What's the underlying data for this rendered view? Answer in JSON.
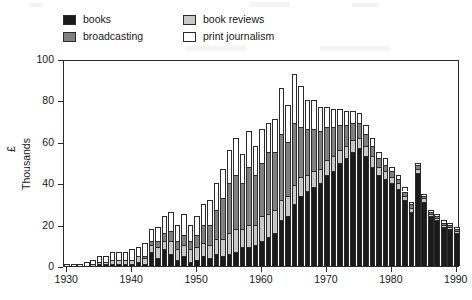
{
  "legend": {
    "items": [
      {
        "label": "books",
        "color": "#1a1a1a",
        "key": "books"
      },
      {
        "label": "broadcasting",
        "color": "#808080",
        "key": "broadcasting"
      },
      {
        "label": "book reviews",
        "color": "#c8c8c8",
        "key": "book_reviews"
      },
      {
        "label": "print journalism",
        "color": "#ffffff",
        "key": "print_journalism"
      }
    ]
  },
  "axes": {
    "y_unit": "£",
    "y_title": "Thousands",
    "y_ticks": [
      "0",
      "20",
      "40",
      "60",
      "80",
      "100"
    ],
    "x_ticks": [
      "1930",
      "1940",
      "1950",
      "1960",
      "1970",
      "1980",
      "1990"
    ]
  },
  "chart_data": {
    "type": "bar",
    "title": "",
    "subtitle": "",
    "xlabel": "",
    "ylabel": "£ Thousands",
    "ylim": [
      0,
      100
    ],
    "xlim": [
      1929.5,
      1990.5
    ],
    "grid": false,
    "stacked": true,
    "legend_position": "top-left",
    "stack_order_bottom_to_top": [
      "books",
      "book_reviews",
      "broadcasting",
      "print_journalism"
    ],
    "annotations": [],
    "categories": [
      1930,
      1931,
      1932,
      1933,
      1934,
      1935,
      1936,
      1937,
      1938,
      1939,
      1940,
      1941,
      1942,
      1943,
      1944,
      1945,
      1946,
      1947,
      1948,
      1949,
      1950,
      1951,
      1952,
      1953,
      1954,
      1955,
      1956,
      1957,
      1958,
      1959,
      1960,
      1961,
      1962,
      1963,
      1964,
      1965,
      1966,
      1967,
      1968,
      1969,
      1970,
      1971,
      1972,
      1973,
      1974,
      1975,
      1976,
      1977,
      1978,
      1979,
      1980,
      1981,
      1982,
      1983,
      1984,
      1985,
      1986,
      1987,
      1988,
      1989,
      1990
    ],
    "series": [
      {
        "name": "books",
        "color": "#1a1a1a",
        "values": [
          0,
          0,
          0,
          0,
          0,
          1,
          1,
          1,
          1,
          1,
          1,
          2,
          1,
          7,
          4,
          8,
          6,
          3,
          5,
          2,
          3,
          5,
          4,
          6,
          5,
          6,
          7,
          9,
          9,
          10,
          12,
          14,
          16,
          22,
          24,
          30,
          34,
          36,
          38,
          40,
          44,
          46,
          50,
          52,
          55,
          57,
          53,
          48,
          44,
          42,
          40,
          37,
          32,
          26,
          45,
          31,
          24,
          22,
          19,
          18,
          16
        ]
      },
      {
        "name": "book_reviews",
        "color": "#c8c8c8",
        "values": [
          0,
          0,
          0,
          0,
          1,
          1,
          1,
          2,
          2,
          2,
          2,
          3,
          3,
          3,
          5,
          4,
          6,
          5,
          5,
          6,
          6,
          6,
          6,
          7,
          8,
          10,
          11,
          9,
          11,
          10,
          12,
          11,
          11,
          10,
          10,
          9,
          9,
          8,
          8,
          7,
          7,
          7,
          6,
          6,
          6,
          5,
          5,
          5,
          4,
          4,
          3,
          3,
          2,
          2,
          2,
          2,
          1,
          1,
          1,
          1,
          1
        ]
      },
      {
        "name": "broadcasting",
        "color": "#808080",
        "values": [
          0,
          0,
          0,
          0,
          0,
          0,
          0,
          0,
          0,
          0,
          0,
          0,
          1,
          2,
          3,
          4,
          5,
          4,
          5,
          4,
          6,
          9,
          10,
          14,
          20,
          24,
          26,
          22,
          28,
          24,
          26,
          30,
          28,
          32,
          26,
          30,
          24,
          22,
          20,
          18,
          16,
          14,
          12,
          10,
          8,
          7,
          6,
          5,
          4,
          3,
          3,
          2,
          2,
          2,
          2,
          1,
          1,
          1,
          1,
          1,
          1
        ]
      },
      {
        "name": "print_journalism",
        "color": "#ffffff",
        "values": [
          1,
          1,
          1,
          2,
          2,
          3,
          3,
          4,
          4,
          4,
          5,
          4,
          6,
          6,
          7,
          8,
          9,
          8,
          10,
          8,
          9,
          10,
          12,
          13,
          14,
          16,
          18,
          14,
          17,
          14,
          16,
          14,
          16,
          22,
          18,
          24,
          20,
          14,
          14,
          12,
          10,
          9,
          8,
          7,
          6,
          5,
          4,
          4,
          3,
          3,
          2,
          2,
          2,
          1,
          1,
          1,
          1,
          1,
          1,
          1,
          1
        ]
      }
    ]
  }
}
